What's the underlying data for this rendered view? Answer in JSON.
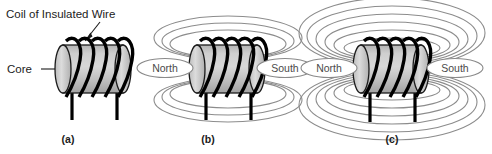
{
  "figure": {
    "title_annotation": "Coil of Insulated Wire",
    "core_annotation": "Core",
    "background_color": "#ffffff",
    "line_color": "#000000",
    "field_line_color": "#8c8c8c",
    "core_fill_light": "#d9d9d9",
    "core_fill_dark": "#9a9a9a",
    "panels": [
      {
        "id": "a",
        "caption": "(a)",
        "field_loop_count": 0,
        "coil_turns": 5,
        "poles": []
      },
      {
        "id": "b",
        "caption": "(b)",
        "field_loop_count": 3,
        "coil_turns": 5,
        "poles": [
          {
            "name": "North",
            "side": "left"
          },
          {
            "name": "South",
            "side": "right"
          }
        ]
      },
      {
        "id": "c",
        "caption": "(c)",
        "field_loop_count": 6,
        "coil_turns": 5,
        "poles": [
          {
            "name": "North",
            "side": "left"
          },
          {
            "name": "South",
            "side": "right"
          }
        ]
      }
    ]
  }
}
